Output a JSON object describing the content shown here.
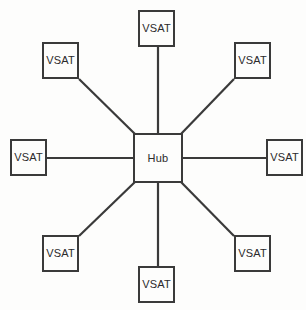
{
  "figure": {
    "kind": "network-topology-diagram",
    "topology": "star",
    "background_color": "#fdfdfc",
    "stroke_color": "#3a3a3a",
    "text_color": "#2b2b2b",
    "width": 306,
    "height": 310
  },
  "hub": {
    "label": "Hub",
    "x": 133,
    "y": 133,
    "width": 50,
    "height": 50
  },
  "nodes": [
    {
      "id": "vsat-n",
      "label": "VSAT",
      "position": "north",
      "x": 138,
      "y": 10
    },
    {
      "id": "vsat-ne",
      "label": "VSAT",
      "position": "north-east",
      "x": 234,
      "y": 42
    },
    {
      "id": "vsat-e",
      "label": "VSAT",
      "position": "east",
      "x": 266,
      "y": 139
    },
    {
      "id": "vsat-se",
      "label": "VSAT",
      "position": "south-east",
      "x": 234,
      "y": 235
    },
    {
      "id": "vsat-s",
      "label": "VSAT",
      "position": "south",
      "x": 138,
      "y": 266
    },
    {
      "id": "vsat-sw",
      "label": "VSAT",
      "position": "south-west",
      "x": 42,
      "y": 235
    },
    {
      "id": "vsat-w",
      "label": "VSAT",
      "position": "west",
      "x": 10,
      "y": 139
    },
    {
      "id": "vsat-nw",
      "label": "VSAT",
      "position": "north-west",
      "x": 42,
      "y": 42
    }
  ],
  "links": [
    {
      "id": "link-n",
      "from": "hub",
      "to": "vsat-n",
      "x1": 158,
      "y1": 133,
      "x2": 158,
      "y2": 47
    },
    {
      "id": "link-ne",
      "from": "hub",
      "to": "vsat-ne",
      "x1": 180,
      "y1": 135,
      "x2": 234,
      "y2": 79
    },
    {
      "id": "link-e",
      "from": "hub",
      "to": "vsat-e",
      "x1": 183,
      "y1": 158,
      "x2": 266,
      "y2": 158
    },
    {
      "id": "link-se",
      "from": "hub",
      "to": "vsat-se",
      "x1": 180,
      "y1": 181,
      "x2": 234,
      "y2": 236
    },
    {
      "id": "link-s",
      "from": "hub",
      "to": "vsat-s",
      "x1": 158,
      "y1": 183,
      "x2": 158,
      "y2": 268
    },
    {
      "id": "link-sw",
      "from": "hub",
      "to": "vsat-sw",
      "x1": 136,
      "y1": 181,
      "x2": 79,
      "y2": 236
    },
    {
      "id": "link-w",
      "from": "hub",
      "to": "vsat-w",
      "x1": 133,
      "y1": 158,
      "x2": 46,
      "y2": 158
    },
    {
      "id": "link-nw",
      "from": "hub",
      "to": "vsat-nw",
      "x1": 136,
      "y1": 135,
      "x2": 79,
      "y2": 79
    }
  ]
}
